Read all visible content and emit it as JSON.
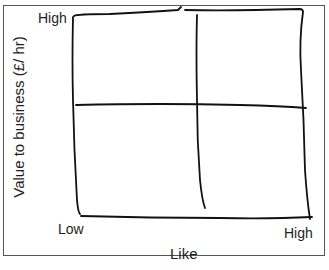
{
  "diagram": {
    "type": "2x2 matrix (hand-drawn)",
    "y_axis": {
      "title": "Value to business (£/ hr)",
      "high_label": "High"
    },
    "x_axis": {
      "title": "Like",
      "low_label": "Low",
      "high_label": "High"
    },
    "quadrants": 4,
    "colors": {
      "line": "#111111",
      "frame": "#555555",
      "background": "#ffffff"
    }
  }
}
